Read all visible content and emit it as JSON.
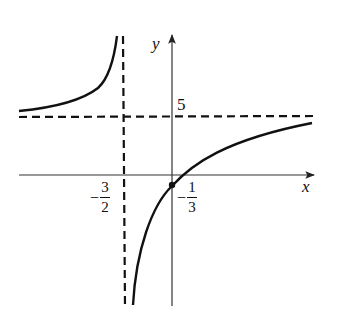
{
  "diagram": {
    "type": "rational-function-graph",
    "axes": {
      "x_label": "x",
      "y_label": "y"
    },
    "vertical_asymptote": {
      "label_sign": "−",
      "label_num": "3",
      "label_den": "2",
      "value": "-3/2"
    },
    "horizontal_asymptote": {
      "label": "5",
      "value": 5
    },
    "intercept": {
      "label_sign": "−",
      "label_num": "1",
      "label_den": "3",
      "value": "-1/3"
    },
    "colors": {
      "curve": "#111111",
      "asymptote": "#111111",
      "axis": "#333333",
      "background": "#ffffff"
    }
  }
}
